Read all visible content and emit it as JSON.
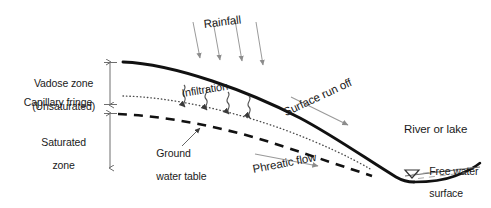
{
  "diagram": {
    "background_color": "#ffffff",
    "line_color": "#1a1a1a",
    "arrow_color": "#8c8c8c",
    "text_color": "#1a1a1a"
  },
  "labels": {
    "vadose_zone_line1": "Vadose zone",
    "vadose_zone_line2": "(Unsaturated)",
    "capillary_fringe": "Capillary fringe",
    "saturated_zone_line1": "Saturated",
    "saturated_zone_line2": "zone",
    "rainfall": "Rainfall",
    "infiltration": "Infiltration",
    "surface_runoff": "Surface run off",
    "ground_water_table_line1": "Ground",
    "ground_water_table_line2": "water table",
    "phreatic_flow": "Phreatic flow",
    "river_or_lake": "River or lake",
    "free_water_line1": "Free water",
    "free_water_line2": "surface"
  },
  "features": {
    "ground_surface_icon": "ground-surface-curve",
    "capillary_fringe_icon": "dotted-line",
    "water_table_icon": "dashed-line",
    "rainfall_icon": "rain-arrows",
    "infiltration_icon": "squiggle-arrows",
    "runoff_icon": "flow-arrow",
    "phreatic_icon": "flow-arrow",
    "free_water_icon": "water-level-triangle",
    "vadose_extent_icon": "double-headed-arrow",
    "saturated_extent_icon": "double-headed-arrow",
    "lake_icon": "lake-basin",
    "gwt_leader_icon": "leader-arrow"
  }
}
